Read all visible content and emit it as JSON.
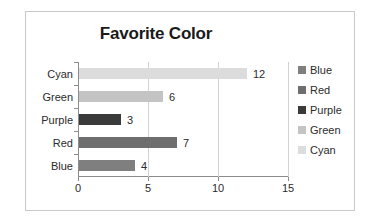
{
  "chart_data": {
    "type": "bar",
    "orientation": "horizontal",
    "title": "Favorite Color",
    "xlabel": "",
    "ylabel": "",
    "categories": [
      "Blue",
      "Red",
      "Purple",
      "Green",
      "Cyan"
    ],
    "values": [
      4,
      7,
      3,
      6,
      12
    ],
    "data_labels": [
      "4",
      "7",
      "3",
      "6",
      "12"
    ],
    "xlim": [
      0,
      15
    ],
    "xticks": [
      0,
      5,
      10,
      15
    ],
    "xtick_labels": [
      "0",
      "5",
      "10",
      "15"
    ],
    "grid": "vertical",
    "legend_position": "right",
    "legend": [
      {
        "label": "Blue",
        "color": "#7f7f7f"
      },
      {
        "label": "Red",
        "color": "#6e6e6e"
      },
      {
        "label": "Purple",
        "color": "#3a3a3a"
      },
      {
        "label": "Green",
        "color": "#c4c4c4"
      },
      {
        "label": "Cyan",
        "color": "#dcdcdc"
      }
    ],
    "bar_colors": {
      "Blue": "#7f7f7f",
      "Red": "#6e6e6e",
      "Purple": "#3a3a3a",
      "Green": "#c4c4c4",
      "Cyan": "#dcdcdc"
    },
    "axis_color": "#8c8c8c",
    "gridline_color": "#d3d3d3",
    "border_color": "#c9c9c9",
    "text_color": "#2b2b2b"
  }
}
